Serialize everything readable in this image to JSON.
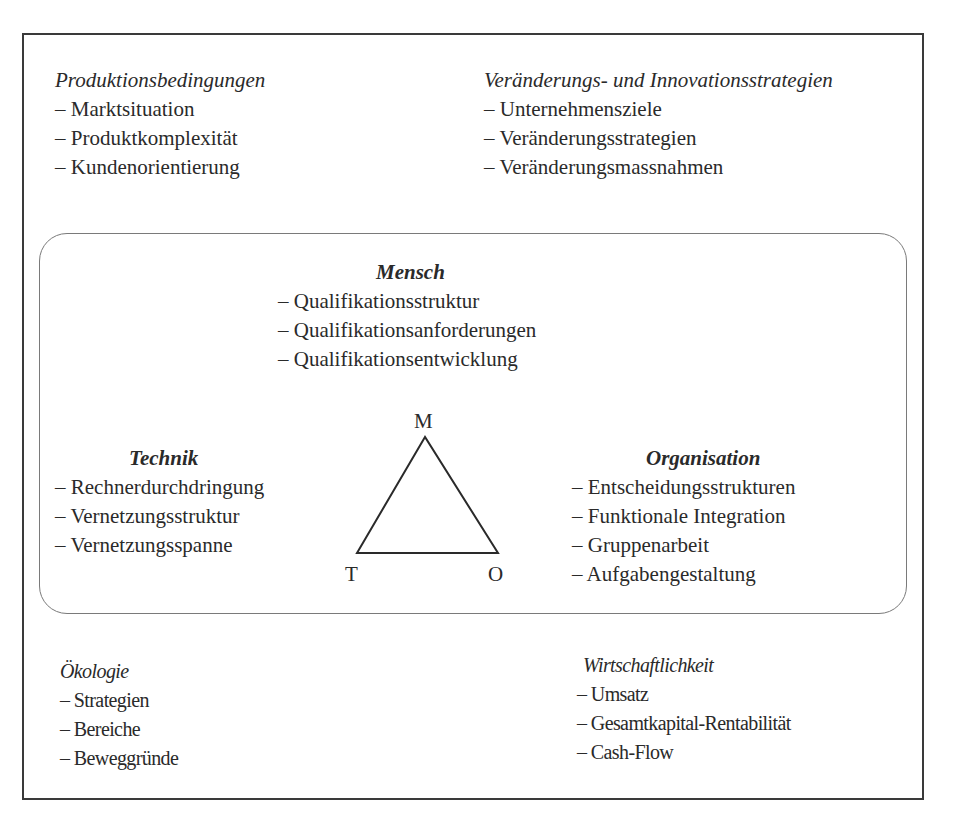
{
  "diagram": {
    "top_left": {
      "title": "Produktionsbedingungen",
      "items": [
        "Marktsituation",
        "Produktkomplexität",
        "Kundenorientierung"
      ]
    },
    "top_right": {
      "title": "Veränderungs- und Innovationsstrategien",
      "items": [
        "Unternehmensziele",
        "Veränderungsstrategien",
        "Veränderungsmassnahmen"
      ]
    },
    "core": {
      "mensch": {
        "title": "Mensch",
        "items": [
          "Qualifikationsstruktur",
          "Qualifikationsanforderungen",
          "Qualifikationsentwicklung"
        ]
      },
      "technik": {
        "title": "Technik",
        "items": [
          "Rechnerdurchdringung",
          "Vernetzungsstruktur",
          "Vernetzungsspanne"
        ]
      },
      "organisation": {
        "title": "Organisation",
        "items": [
          "Entscheidungsstrukturen",
          "Funktionale Integration",
          "Gruppenarbeit",
          "Aufgabengestaltung"
        ]
      },
      "triangle": {
        "top_label": "M",
        "left_label": "T",
        "right_label": "O"
      }
    },
    "bottom_left": {
      "title": "Ökologie",
      "items": [
        "Strategien",
        "Bereiche",
        "Beweggründe"
      ]
    },
    "bottom_right": {
      "title": "Wirtschaftlichkeit",
      "items": [
        "Umsatz",
        "Gesamtkapital-Rentabilität",
        "Cash-Flow"
      ]
    }
  }
}
